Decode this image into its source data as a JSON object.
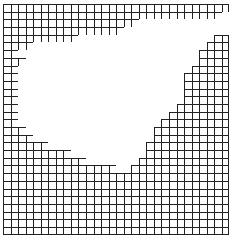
{
  "diagram": {
    "title": "",
    "type": "grid-cluster",
    "cols": 30,
    "rows": 30,
    "line_color": "#222222",
    "background": "#ffffff",
    "blank_cells_by_row": [
      [],
      [
        28
      ],
      [
        18,
        19,
        20,
        21,
        22,
        23,
        24,
        25,
        26,
        27,
        28,
        29
      ],
      [
        16,
        17,
        18,
        19,
        20,
        21,
        22,
        23,
        24,
        25,
        26,
        27,
        28,
        29
      ],
      [
        19,
        20,
        21,
        22,
        23,
        24,
        25,
        26,
        27,
        28,
        29
      ],
      [],
      [],
      [],
      [],
      [],
      [],
      [],
      [],
      [],
      [],
      [],
      [],
      [],
      [],
      [],
      [],
      [],
      [],
      [],
      [],
      [],
      [],
      [],
      [],
      []
    ],
    "blank_spans": [
      [
        0,
        30,
        30
      ],
      [
        1,
        29,
        30
      ],
      [
        2,
        18,
        30
      ],
      [
        3,
        16,
        30
      ],
      [
        4,
        10,
        28
      ],
      [
        5,
        4,
        27
      ],
      [
        6,
        2,
        26
      ],
      [
        7,
        3,
        26
      ],
      [
        8,
        2,
        25
      ],
      [
        9,
        2,
        24
      ],
      [
        10,
        2,
        24
      ],
      [
        11,
        2,
        24
      ],
      [
        12,
        2,
        24
      ],
      [
        13,
        2,
        23
      ],
      [
        14,
        2,
        22
      ],
      [
        15,
        2,
        21
      ],
      [
        16,
        3,
        20
      ],
      [
        17,
        4,
        20
      ],
      [
        18,
        6,
        19
      ],
      [
        19,
        9,
        19
      ],
      [
        20,
        11,
        18
      ],
      [
        21,
        15,
        17
      ],
      [
        22,
        30,
        30
      ],
      [
        23,
        30,
        30
      ],
      [
        24,
        30,
        30
      ],
      [
        25,
        30,
        30
      ],
      [
        26,
        30,
        30
      ],
      [
        27,
        30,
        30
      ],
      [
        28,
        30,
        30
      ],
      [
        29,
        30,
        30
      ]
    ]
  }
}
